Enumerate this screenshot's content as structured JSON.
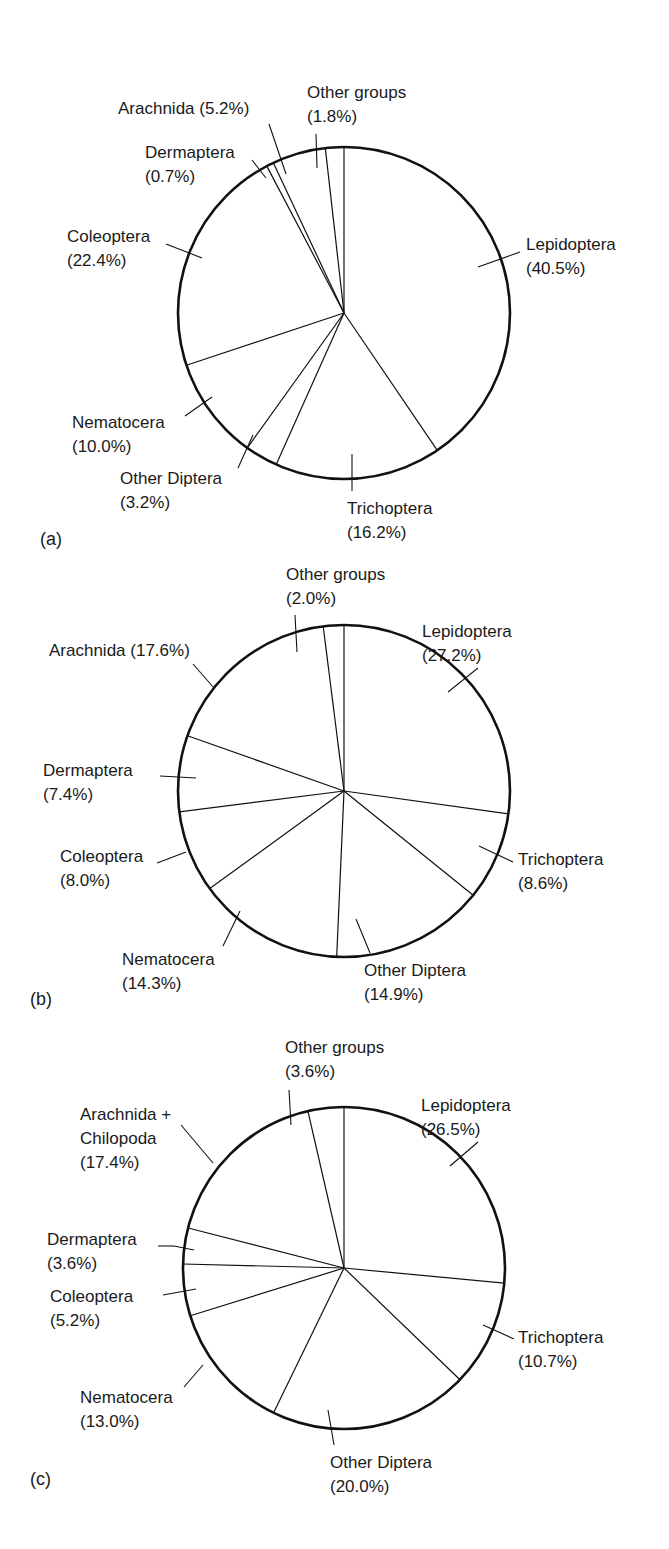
{
  "chart_data": [
    {
      "panel": "(a)",
      "type": "pie",
      "categories": [
        "Lepidoptera",
        "Trichoptera",
        "Other Diptera",
        "Nematocera",
        "Coleoptera",
        "Dermaptera",
        "Arachnida",
        "Other groups"
      ],
      "values": [
        40.5,
        16.2,
        3.2,
        10.0,
        22.4,
        0.7,
        5.2,
        1.8
      ],
      "value_labels": [
        "(40.5%)",
        "(16.2%)",
        "(3.2%)",
        "(10.0%)",
        "(22.4%)",
        "(0.7%)",
        "(5.2%)",
        "(1.8%)"
      ],
      "start_angle": "12 o'clock",
      "direction": "clockwise",
      "title": "",
      "legend": "none (direct labels with leader lines)"
    },
    {
      "panel": "(b)",
      "type": "pie",
      "categories": [
        "Lepidoptera",
        "Trichoptera",
        "Other Diptera",
        "Nematocera",
        "Coleoptera",
        "Dermaptera",
        "Arachnida",
        "Other groups"
      ],
      "values": [
        27.2,
        8.6,
        14.9,
        14.3,
        8.0,
        7.4,
        17.6,
        2.0
      ],
      "value_labels": [
        "(27.2%)",
        "(8.6%)",
        "(14.9%)",
        "(14.3%)",
        "(8.0%)",
        "(7.4%)",
        "(17.6%)",
        "(2.0%)"
      ],
      "start_angle": "12 o'clock",
      "direction": "clockwise",
      "title": "",
      "legend": "none (direct labels with leader lines)"
    },
    {
      "panel": "(c)",
      "type": "pie",
      "categories": [
        "Lepidoptera",
        "Trichoptera",
        "Other Diptera",
        "Nematocera",
        "Coleoptera",
        "Dermaptera",
        "Arachnida + Chilopoda",
        "Other groups"
      ],
      "values": [
        26.5,
        10.7,
        20.0,
        13.0,
        5.2,
        3.6,
        17.4,
        3.6
      ],
      "value_labels": [
        "(26.5%)",
        "(10.7%)",
        "(20.0%)",
        "(13.0%)",
        "(5.2%)",
        "(3.6%)",
        "(17.4%)",
        "(3.6%)"
      ],
      "start_angle": "12 o'clock",
      "direction": "clockwise",
      "title": "",
      "legend": "none (direct labels with leader lines)"
    }
  ],
  "panels": {
    "a": {
      "tag": "(a)",
      "labels": [
        {
          "line1": "Lepidoptera",
          "line2": "(40.5%)"
        },
        {
          "line1": "Trichoptera",
          "line2": "(16.2%)"
        },
        {
          "line1": "Other Diptera",
          "line2": "(3.2%)"
        },
        {
          "line1": "Nematocera",
          "line2": "(10.0%)"
        },
        {
          "line1": "Coleoptera",
          "line2": "(22.4%)"
        },
        {
          "line1": "Dermaptera",
          "line2": "(0.7%)"
        },
        {
          "line1": "Arachnida (5.2%)",
          "line2": ""
        },
        {
          "line1": "Other groups",
          "line2": "(1.8%)"
        }
      ]
    },
    "b": {
      "tag": "(b)",
      "labels": [
        {
          "line1": "Lepidoptera",
          "line2": "(27.2%)"
        },
        {
          "line1": "Trichoptera",
          "line2": "(8.6%)"
        },
        {
          "line1": "Other Diptera",
          "line2": "(14.9%)"
        },
        {
          "line1": "Nematocera",
          "line2": "(14.3%)"
        },
        {
          "line1": "Coleoptera",
          "line2": "(8.0%)"
        },
        {
          "line1": "Dermaptera",
          "line2": "(7.4%)"
        },
        {
          "line1": "Arachnida (17.6%)",
          "line2": ""
        },
        {
          "line1": "Other groups",
          "line2": "(2.0%)"
        }
      ]
    },
    "c": {
      "tag": "(c)",
      "labels": [
        {
          "line1": "Lepidoptera",
          "line2": "(26.5%)"
        },
        {
          "line1": "Trichoptera",
          "line2": "(10.7%)"
        },
        {
          "line1": "Other Diptera",
          "line2": "(20.0%)"
        },
        {
          "line1": "Nematocera",
          "line2": "(13.0%)"
        },
        {
          "line1": "Coleoptera",
          "line2": "(5.2%)"
        },
        {
          "line1": "Dermaptera",
          "line2": "(3.6%)"
        },
        {
          "line1": "Arachnida +",
          "line2": "Chilopoda",
          "line3": "(17.4%)"
        },
        {
          "line1": "Other groups",
          "line2": "(3.6%)"
        }
      ]
    }
  }
}
